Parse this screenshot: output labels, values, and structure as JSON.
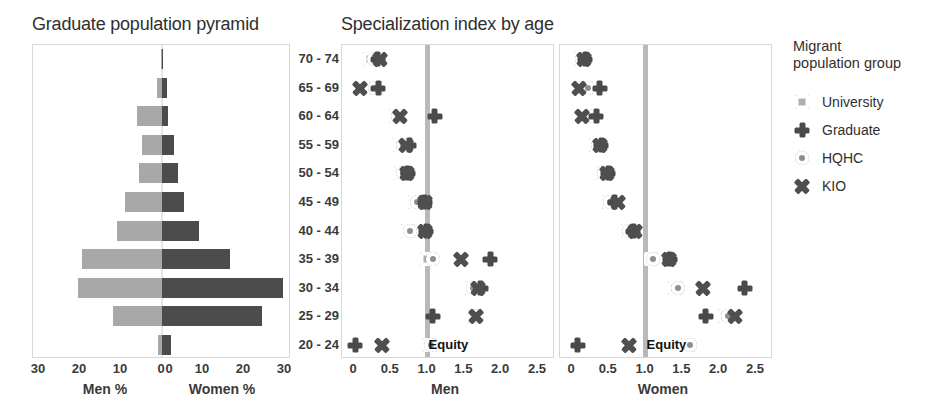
{
  "titles": {
    "pyramid": "Graduate population pyramid",
    "specialization": "Specialization index by age"
  },
  "legend": {
    "title_line1": "Migrant",
    "title_line2": "population group",
    "items": [
      {
        "label": "University",
        "marker": "square-icon",
        "color": "#b0b0b0"
      },
      {
        "label": "Graduate",
        "marker": "plus-icon",
        "color": "#4a4a4a"
      },
      {
        "label": "HQHC",
        "marker": "circle-icon",
        "color": "#8e8e8e"
      },
      {
        "label": "KIO",
        "marker": "x-icon",
        "color": "#4f4f4f"
      }
    ]
  },
  "age_groups": [
    "70 - 74",
    "65 - 69",
    "60 - 64",
    "55 - 59",
    "50 - 54",
    "45 - 49",
    "40 - 44",
    "35 - 39",
    "30 - 34",
    "25 - 29",
    "20 - 24"
  ],
  "equity_label": "Equity",
  "chart_data": [
    {
      "type": "bar",
      "title": "Graduate population pyramid",
      "orientation": "horizontal-diverging",
      "categories": [
        "70 - 74",
        "65 - 69",
        "60 - 64",
        "55 - 59",
        "50 - 54",
        "45 - 49",
        "40 - 44",
        "35 - 39",
        "30 - 34",
        "25 - 29",
        "20 - 24"
      ],
      "series": [
        {
          "name": "Men %",
          "color": "#a8a8a8",
          "values": [
            0.3,
            1.1,
            6.0,
            5.0,
            5.5,
            9.0,
            11.0,
            19.5,
            20.5,
            12.0,
            1.0
          ]
        },
        {
          "name": "Women %",
          "color": "#4c4c4c",
          "values": [
            0.2,
            1.3,
            1.4,
            2.9,
            4.0,
            5.3,
            9.0,
            16.5,
            29.5,
            24.5,
            2.2
          ]
        }
      ],
      "xlabel_left": "Men %",
      "xlabel_right": "Women %",
      "xticks_left": [
        "30",
        "20",
        "10",
        "0"
      ],
      "xticks_right": [
        "0",
        "10",
        "20",
        "30"
      ],
      "xlim": [
        0,
        30
      ],
      "grid": false
    },
    {
      "type": "scatter",
      "title": "Specialization index by age",
      "panel": "Men",
      "xlabel": "Men",
      "xticks": [
        "0",
        "0.5",
        "1.0",
        "1.5",
        "2.0",
        "2.5"
      ],
      "xlim": [
        0,
        2.65
      ],
      "reference_line": {
        "value": 1.0,
        "label": "Equity"
      },
      "categories": [
        "70 - 74",
        "65 - 69",
        "60 - 64",
        "55 - 59",
        "50 - 54",
        "45 - 49",
        "40 - 44",
        "35 - 39",
        "30 - 34",
        "25 - 29",
        "20 - 24"
      ],
      "series": [
        {
          "name": "University",
          "marker": "square-icon",
          "values": [
            0.22,
            0.3,
            0.57,
            0.62,
            0.64,
            0.83,
            0.73,
            0.99,
            1.6,
            1.65,
            1.03
          ]
        },
        {
          "name": "Graduate",
          "marker": "plus-icon",
          "values": [
            0.32,
            0.33,
            1.1,
            0.75,
            0.73,
            0.96,
            0.98,
            1.85,
            1.72,
            1.07,
            0.02
          ]
        },
        {
          "name": "HQHC",
          "marker": "circle-icon",
          "values": [
            0.27,
            0.28,
            0.6,
            0.66,
            0.67,
            0.86,
            0.76,
            1.08,
            1.62,
            1.67,
            1.05
          ]
        },
        {
          "name": "KIO",
          "marker": "x-icon",
          "values": [
            0.35,
            0.08,
            0.62,
            0.7,
            0.72,
            0.97,
            0.97,
            1.45,
            1.68,
            1.66,
            0.38
          ]
        }
      ]
    },
    {
      "type": "scatter",
      "title": "Specialization index by age",
      "panel": "Women",
      "xlabel": "Women",
      "xticks": [
        "0",
        "0.5",
        "1.0",
        "1.5",
        "2.0",
        "2.5"
      ],
      "xlim": [
        0,
        2.65
      ],
      "reference_line": {
        "value": 1.0,
        "label": "Equity"
      },
      "categories": [
        "70 - 74",
        "65 - 69",
        "60 - 64",
        "55 - 59",
        "50 - 54",
        "45 - 49",
        "40 - 44",
        "35 - 39",
        "30 - 34",
        "25 - 29",
        "20 - 24"
      ],
      "series": [
        {
          "name": "University",
          "marker": "square-icon",
          "values": [
            0.12,
            0.19,
            0.27,
            0.33,
            0.42,
            0.5,
            0.76,
            1.08,
            1.4,
            2.08,
            1.58
          ]
        },
        {
          "name": "Graduate",
          "marker": "plus-icon",
          "values": [
            0.18,
            0.38,
            0.33,
            0.4,
            0.49,
            0.58,
            0.83,
            1.33,
            2.35,
            1.82,
            0.08
          ]
        },
        {
          "name": "HQHC",
          "marker": "circle-icon",
          "values": [
            0.14,
            0.22,
            0.29,
            0.35,
            0.44,
            0.52,
            0.78,
            1.1,
            1.44,
            2.12,
            1.6
          ]
        },
        {
          "name": "KIO",
          "marker": "x-icon",
          "values": [
            0.16,
            0.1,
            0.14,
            0.38,
            0.47,
            0.62,
            0.85,
            1.32,
            1.78,
            2.22,
            0.78
          ]
        }
      ]
    }
  ]
}
